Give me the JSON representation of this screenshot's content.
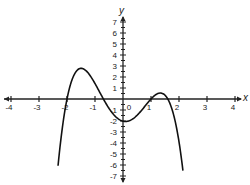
{
  "chart_data": {
    "type": "line",
    "title": "",
    "xlabel": "x",
    "ylabel": "y",
    "xlim": [
      -4,
      4
    ],
    "ylim": [
      -7,
      7
    ],
    "x_ticks": [
      -4,
      -3,
      -2,
      -1,
      0,
      1,
      2,
      3,
      4
    ],
    "x_tick_labels": [
      "-4",
      "-3",
      "-2",
      "-1",
      "0",
      "1",
      "2",
      "3",
      "4"
    ],
    "y_ticks": [
      7,
      6,
      5,
      4,
      3,
      2,
      1,
      -1,
      -2,
      -3,
      -4,
      -5,
      -6,
      -7
    ],
    "y_tick_labels": [
      "7",
      "6",
      "5",
      "4",
      "3",
      "2",
      "1",
      "-1",
      "-2",
      "-3",
      "-4",
      "-5",
      "-6",
      "-7"
    ],
    "grid": false,
    "legend": null,
    "series": [
      {
        "name": "polynomial curve",
        "description": "Quartic with negative leading coefficient; roots near -2, -0.7, 1, 1.6",
        "coefficients_factored": {
          "k": -0.9,
          "roots": [
            -2,
            -0.7,
            1,
            1.6
          ]
        },
        "x_range": [
          -2.32,
          2.14
        ],
        "key_points": [
          {
            "x": -2.3,
            "y": -7,
            "label": "left end"
          },
          {
            "x": -2,
            "y": 0,
            "label": "root"
          },
          {
            "x": -1.5,
            "y": 3.3,
            "label": "local max"
          },
          {
            "x": -0.7,
            "y": 0,
            "label": "root"
          },
          {
            "x": -0.1,
            "y": -2,
            "label": "local min"
          },
          {
            "x": 1,
            "y": 0,
            "label": "root"
          },
          {
            "x": 1.35,
            "y": 0.6,
            "label": "local max"
          },
          {
            "x": 1.6,
            "y": 0,
            "label": "root"
          },
          {
            "x": 2.14,
            "y": -6.7,
            "label": "right end"
          }
        ]
      }
    ]
  }
}
